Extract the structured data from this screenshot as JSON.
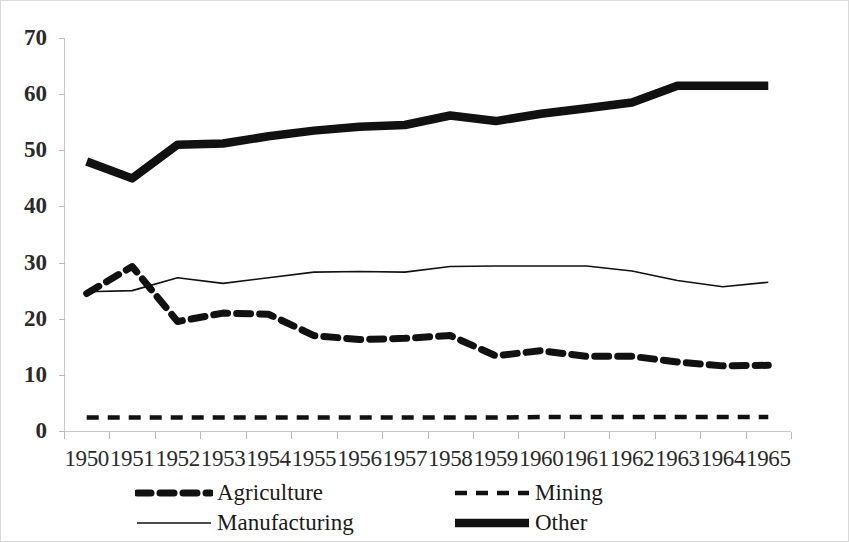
{
  "chart_data": {
    "type": "line",
    "title": "",
    "subtitle": "",
    "xlabel": "",
    "ylabel": "",
    "xlim": [
      1950,
      1965
    ],
    "ylim": [
      0,
      70
    ],
    "grid": false,
    "legend_position": "bottom",
    "y_ticks": [
      0,
      10,
      20,
      30,
      40,
      50,
      60,
      70
    ],
    "y_tick_labels": [
      "0",
      "10",
      "20",
      "30",
      "40",
      "50",
      "60",
      "70"
    ],
    "categories": [
      "1950",
      "1951",
      "1952",
      "1953",
      "1954",
      "1955",
      "1956",
      "1957",
      "1958",
      "1959",
      "1960",
      "1961",
      "1962",
      "1963",
      "1964",
      "1965"
    ],
    "series": [
      {
        "name": "Agriculture",
        "style": "thick-dashed",
        "color": "#111111",
        "values": [
          24.5,
          29.3,
          19.5,
          21.0,
          20.8,
          17.0,
          16.3,
          16.5,
          17.0,
          13.4,
          14.3,
          13.3,
          13.3,
          12.3,
          11.6,
          11.7
        ]
      },
      {
        "name": "Mining",
        "style": "thin-dashed",
        "color": "#111111",
        "values": [
          2.4,
          2.4,
          2.4,
          2.4,
          2.4,
          2.4,
          2.4,
          2.4,
          2.4,
          2.4,
          2.5,
          2.5,
          2.5,
          2.5,
          2.5,
          2.5
        ]
      },
      {
        "name": "Manufacturing",
        "style": "thin-solid",
        "color": "#111111",
        "values": [
          24.8,
          25.0,
          27.3,
          26.3,
          27.3,
          28.3,
          28.4,
          28.3,
          29.3,
          29.4,
          29.4,
          29.4,
          28.5,
          26.8,
          25.7,
          26.5
        ]
      },
      {
        "name": "Other",
        "style": "very-thick-solid",
        "color": "#111111",
        "values": [
          48.0,
          45.0,
          51.0,
          51.2,
          52.5,
          53.5,
          54.2,
          54.5,
          56.2,
          55.2,
          56.5,
          57.5,
          58.5,
          61.5,
          61.5,
          61.5
        ]
      }
    ]
  },
  "legend": {
    "items": [
      {
        "label": "Agriculture",
        "style": "thick-dashed"
      },
      {
        "label": "Mining",
        "style": "thin-dashed"
      },
      {
        "label": "Manufacturing",
        "style": "thin-solid"
      },
      {
        "label": "Other",
        "style": "very-thick-solid"
      }
    ]
  },
  "colors": {
    "ink": "#111111",
    "axis": "#c9c9c9",
    "tick": "#b8b8b8",
    "background": "#ffffff",
    "border": "#d9d9d9"
  }
}
